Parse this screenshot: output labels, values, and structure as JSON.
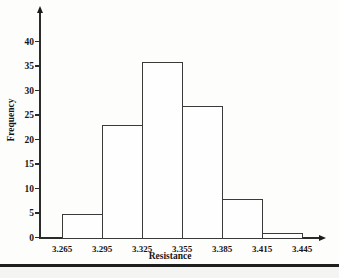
{
  "chart_data": {
    "type": "bar",
    "subtype": "histogram",
    "title": "",
    "xlabel": "Resistance",
    "ylabel": "Frequency",
    "bin_edges": [
      3.265,
      3.295,
      3.325,
      3.355,
      3.385,
      3.415,
      3.445
    ],
    "bin_edge_labels": [
      "3.265",
      "3.295",
      "3.325",
      "3.355",
      "3.385",
      "3.415",
      "3.445"
    ],
    "values": [
      5,
      23,
      36,
      27,
      8,
      1
    ],
    "y_ticks": [
      0,
      5,
      10,
      15,
      20,
      25,
      30,
      35,
      40
    ],
    "ylim": [
      0,
      43
    ],
    "grid": false,
    "legend": false,
    "bar_fill": "#fefefe",
    "line_color": "#2b2b2b",
    "text_color": "#161616"
  },
  "page": {
    "background": "#fdfdfc",
    "bottom_rule_color": "#1f1f1f"
  }
}
